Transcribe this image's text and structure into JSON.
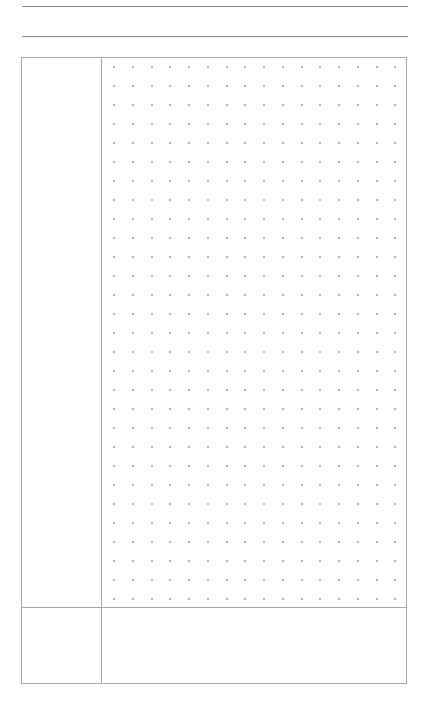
{
  "page": {
    "type": "cornell-notes-dot-grid",
    "background": "#ffffff",
    "line_color": "#8a8a8a",
    "border_color": "#a8a8a8",
    "dot_color": "#9a9a9a"
  },
  "header": {
    "lines": [
      {
        "name": "title-line",
        "y": 6
      },
      {
        "name": "date-line",
        "y": 36
      }
    ]
  },
  "layout": {
    "cue_column": {
      "label": ""
    },
    "notes_area": {
      "grid": {
        "columns": 16,
        "rows": 29,
        "origin_x": 12,
        "origin_y": 8,
        "spacing_x": 18.75,
        "spacing_y": 19
      }
    },
    "summary": {
      "label": ""
    }
  }
}
